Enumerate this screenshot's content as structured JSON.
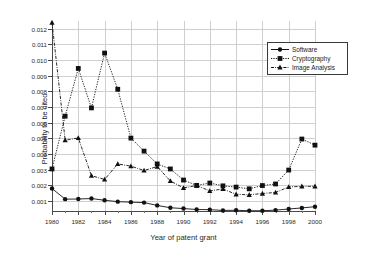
{
  "chart_data": {
    "type": "line",
    "title": "",
    "xlabel": "Year of patent grant",
    "ylabel": "Probability to be cited",
    "xlim": [
      1980,
      2000
    ],
    "ylim": [
      0.0003,
      0.0125
    ],
    "grid": true,
    "legend_position": "top-right",
    "x": [
      1980,
      1981,
      1982,
      1983,
      1984,
      1985,
      1986,
      1987,
      1988,
      1989,
      1990,
      1991,
      1992,
      1993,
      1994,
      1995,
      1996,
      1997,
      1998,
      1999,
      2000
    ],
    "xticks": [
      1980,
      1982,
      1984,
      1986,
      1988,
      1990,
      1992,
      1994,
      1996,
      1998,
      2000
    ],
    "xtick_labels": [
      "1980",
      "1982",
      "1984",
      "1986",
      "1988",
      "1990",
      "1992",
      "1994",
      "1996",
      "1998",
      "2000"
    ],
    "yticks": [
      0.001,
      0.002,
      0.003,
      0.004,
      0.005,
      0.006,
      0.007,
      0.008,
      0.009,
      0.01,
      0.011,
      0.012
    ],
    "ytick_labels": [
      "0.001",
      "0.002",
      "0.003",
      "0.004",
      "0.005",
      "0.006",
      "0.007",
      "0.008",
      "0.009",
      "0.010",
      "0.011",
      "0.012"
    ],
    "series": [
      {
        "name": "Software",
        "marker": "circle",
        "line_style": "solid",
        "color": "#111111",
        "values": [
          0.0018,
          0.00112,
          0.00113,
          0.00116,
          0.00105,
          0.00096,
          0.00093,
          0.0009,
          0.00072,
          0.00057,
          0.00052,
          0.00046,
          0.00045,
          0.0004,
          0.00041,
          0.00038,
          0.00038,
          0.00042,
          0.00049,
          0.00056,
          0.00064
        ]
      },
      {
        "name": "Cryptography",
        "marker": "square",
        "line_style": "dotted",
        "color": "#111111",
        "values": [
          0.00305,
          0.00642,
          0.00947,
          0.00695,
          0.01045,
          0.00814,
          0.00502,
          0.00419,
          0.00337,
          0.00305,
          0.00234,
          0.002,
          0.00215,
          0.00197,
          0.00189,
          0.00178,
          0.00199,
          0.00209,
          0.00298,
          0.00496,
          0.00457
        ]
      },
      {
        "name": "Image Analysis",
        "marker": "triangle",
        "line_style": "dashdot",
        "color": "#111111",
        "values": [
          0.0124,
          0.00489,
          0.00503,
          0.00262,
          0.00238,
          0.00337,
          0.00323,
          0.00295,
          0.0032,
          0.00228,
          0.00184,
          0.00199,
          0.00165,
          0.00177,
          0.00143,
          0.0014,
          0.00148,
          0.00155,
          0.0019,
          0.00194,
          0.00194
        ]
      }
    ]
  },
  "legend": {
    "entries": [
      {
        "label": "Software"
      },
      {
        "label": "Cryptography"
      },
      {
        "label": "Image Analysis"
      }
    ]
  }
}
